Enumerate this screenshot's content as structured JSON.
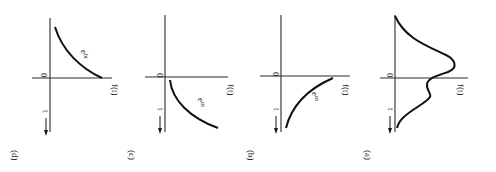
{
  "figure": {
    "orientation": "rotated-90-clockwise",
    "panels": [
      {
        "id": "d",
        "label": "(d)",
        "origin_label": "0",
        "x_axis_label": "t",
        "y_axis_label": "f(t)",
        "curve_label": "e",
        "curve_exp": "bt",
        "description": "decaying exponential, positive for t>0 starting high"
      },
      {
        "id": "c",
        "label": "(c)",
        "origin_label": "0",
        "x_axis_label": "t",
        "y_axis_label": "f(t)",
        "curve_label": "e",
        "curve_exp": "αt",
        "description": "growing exponential for t>0 starting at 1"
      },
      {
        "id": "b",
        "label": "(b)",
        "origin_label": "0",
        "x_axis_label": "t",
        "y_axis_label": "f(t)",
        "curve_label": "e",
        "curve_exp": "αt",
        "description": "exponential for t<0 approaching 1 at origin"
      },
      {
        "id": "a",
        "label": "(a)",
        "origin_label": "0",
        "x_axis_label": "t",
        "y_axis_label": "f(t)",
        "description": "two-sided pulse with main peak for t<0 and smaller bump for t>0"
      }
    ]
  }
}
